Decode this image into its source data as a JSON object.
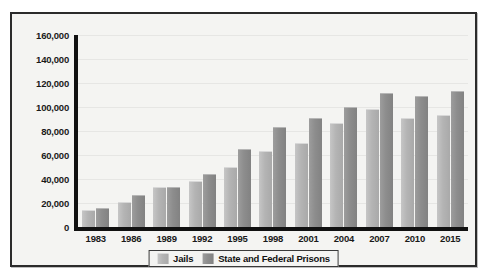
{
  "chart_data": {
    "type": "bar",
    "title": "",
    "subtitle": "",
    "xlabel": "",
    "ylabel": "",
    "grid": true,
    "legend_position": "bottom",
    "categories": [
      "1983",
      "1986",
      "1989",
      "1992",
      "1995",
      "1998",
      "2001",
      "2004",
      "2007",
      "2010",
      "2015"
    ],
    "ylim": [
      0,
      160000
    ],
    "ytick_labels": [
      "160,000",
      "140,000",
      "120,000",
      "100,000",
      "80,000",
      "60,000",
      "40,000",
      "20,000",
      "0"
    ],
    "ytick_values": [
      160000,
      140000,
      120000,
      100000,
      80000,
      60000,
      40000,
      20000,
      0
    ],
    "series": [
      {
        "name": "Jails",
        "color": "#b4b4b4",
        "values": [
          14000,
          21000,
          33000,
          38000,
          50000,
          63000,
          70000,
          87000,
          98000,
          91000,
          93000
        ]
      },
      {
        "name": "State and Federal Prisons",
        "color": "#8d8d8d",
        "values": [
          16000,
          27000,
          33000,
          44000,
          65000,
          83000,
          91000,
          100000,
          112000,
          109000,
          113000
        ]
      }
    ]
  },
  "legend": {
    "items": [
      {
        "label": "Jails",
        "swatch": "jails"
      },
      {
        "label": "State and Federal Prisons",
        "swatch": "prisons"
      }
    ]
  }
}
